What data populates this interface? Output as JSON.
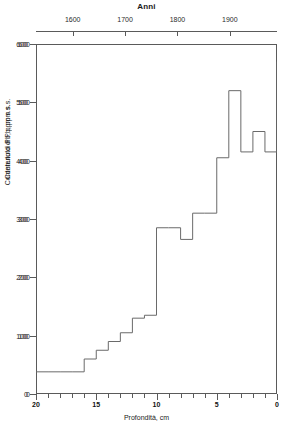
{
  "figure": {
    "title": "Anni"
  },
  "top_axis": {
    "label": "Anni",
    "ticks": [
      {
        "value": 1600,
        "label": "1600"
      },
      {
        "value": 1700,
        "label": "1700"
      },
      {
        "value": 1800,
        "label": "1800"
      },
      {
        "value": 1900,
        "label": "1900"
      }
    ],
    "range": [
      1530,
      1990
    ]
  },
  "y_axis": {
    "label": "Contenuto di Pb, ppm s.s.",
    "label_overlay": "Contenuto di Pb, ppm s.s.",
    "ticks": [
      {
        "value": 0,
        "label": "0"
      },
      {
        "value": 100,
        "label": "100"
      },
      {
        "value": 200,
        "label": "200"
      },
      {
        "value": 300,
        "label": "300"
      },
      {
        "value": 400,
        "label": "400"
      },
      {
        "value": 500,
        "label": "500"
      },
      {
        "value": 600,
        "label": "600"
      }
    ],
    "range": [
      0,
      600
    ]
  },
  "x_axis": {
    "label": "Profondità, cm",
    "major_ticks": [
      {
        "value": 20,
        "label": "20"
      },
      {
        "value": 15,
        "label": "15"
      },
      {
        "value": 10,
        "label": "10"
      },
      {
        "value": 5,
        "label": "5"
      },
      {
        "value": 0,
        "label": "0"
      }
    ],
    "minor_tick_interval": 1,
    "range": [
      20,
      0
    ],
    "reversed": true
  },
  "chart_data": {
    "type": "line",
    "subtype": "step",
    "title": "Anni",
    "xlabel": "Profondità, cm",
    "ylabel": "Contenuto di Pb, ppm s.s.",
    "xlim": [
      20,
      0
    ],
    "ylim": [
      0,
      600
    ],
    "x_reversed": true,
    "grid": false,
    "legend": null,
    "secondary_xaxis": {
      "label": "Anni",
      "ticks": [
        1600,
        1700,
        1800,
        1900
      ]
    },
    "step_mode": "post",
    "x": [
      20,
      19,
      18,
      17,
      16,
      15,
      14,
      13,
      12,
      11,
      10,
      9,
      8,
      7,
      6,
      5,
      4,
      3,
      2,
      1,
      0
    ],
    "categories": [
      "20",
      "19",
      "18",
      "17",
      "16",
      "15",
      "14",
      "13",
      "12",
      "11",
      "10",
      "9",
      "8",
      "7",
      "6",
      "5",
      "4",
      "3",
      "2",
      "1",
      "0"
    ],
    "values": [
      38,
      38,
      38,
      38,
      60,
      75,
      90,
      105,
      130,
      135,
      285,
      285,
      265,
      310,
      310,
      405,
      520,
      415,
      450,
      415,
      570
    ],
    "series": [
      {
        "name": "Pb",
        "values": [
          38,
          38,
          38,
          38,
          60,
          75,
          90,
          105,
          130,
          135,
          285,
          285,
          265,
          310,
          310,
          405,
          520,
          415,
          450,
          415,
          570
        ]
      }
    ]
  },
  "style": {
    "line_color": "#6a6a6a",
    "axis_color": "#5a5a5a",
    "background": "#ffffff"
  }
}
